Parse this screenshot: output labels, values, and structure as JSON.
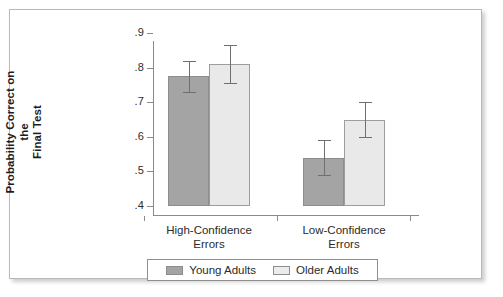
{
  "chart_data": {
    "type": "bar",
    "title": "",
    "xlabel": "",
    "ylabel": "Probability Correct on the Final Test",
    "ylabel_lines": [
      "Probability Correct on the",
      "Final Test"
    ],
    "categories": [
      "High-Confidence Errors",
      "Low-Confidence Errors"
    ],
    "category_lines": [
      [
        "High-Confidence",
        "Errors"
      ],
      [
        "Low-Confidence",
        "Errors"
      ]
    ],
    "ylim": [
      0.4,
      0.9
    ],
    "ytick_labels": [
      ".9",
      ".8",
      ".7",
      ".6",
      ".5",
      ".4"
    ],
    "ytick_values": [
      0.9,
      0.8,
      0.7,
      0.6,
      0.5,
      0.4
    ],
    "grid": false,
    "legend_position": "bottom",
    "series": [
      {
        "name": "Young Adults",
        "color": "#a4a4a4",
        "values": [
          0.775,
          0.54
        ],
        "errors": [
          0.045,
          0.05
        ]
      },
      {
        "name": "Older Adults",
        "color": "#e9e9e9",
        "values": [
          0.81,
          0.65
        ],
        "errors": [
          0.055,
          0.05
        ]
      }
    ]
  },
  "axis": {
    "y_title_line1": "Probability Correct on the",
    "y_title_line2": "Final Test",
    "ticks": [
      {
        "label": ".9",
        "value": 0.9
      },
      {
        "label": ".8",
        "value": 0.8
      },
      {
        "label": ".7",
        "value": 0.7
      },
      {
        "label": ".6",
        "value": 0.6
      },
      {
        "label": ".5",
        "value": 0.5
      },
      {
        "label": ".4",
        "value": 0.4
      }
    ]
  },
  "categories": [
    {
      "line1": "High-Confidence",
      "line2": "Errors"
    },
    {
      "line1": "Low-Confidence",
      "line2": "Errors"
    }
  ],
  "legend": {
    "items": [
      {
        "label": "Young Adults",
        "color": "#a4a4a4"
      },
      {
        "label": "Older Adults",
        "color": "#e9e9e9"
      }
    ]
  },
  "colors": {
    "young_adults": "#a4a4a4",
    "older_adults": "#e9e9e9",
    "axis": "#8a8a8a",
    "error_bar": "#6f6f6f",
    "frame": "#b9b9b9",
    "text": "#2b2b2b"
  }
}
